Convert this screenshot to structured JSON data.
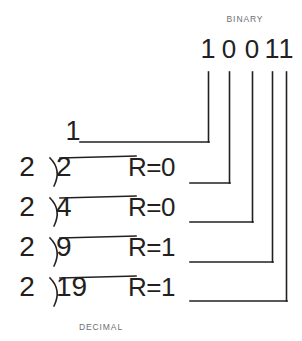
{
  "figure": {
    "title_top": "BINARY",
    "title_bottom": "DECIMAL",
    "ink_color": "#231f20",
    "label_color": "#6d6e71",
    "background": "#ffffff"
  },
  "binary_result": {
    "digits": [
      "1",
      "0",
      "0",
      "1",
      "1"
    ],
    "value": "10011"
  },
  "quotient_top": {
    "value": "1"
  },
  "divisions": [
    {
      "divisor": "2",
      "dividend": "2",
      "remainder_label": "R=0",
      "remainder_value": "0"
    },
    {
      "divisor": "2",
      "dividend": "4",
      "remainder_label": "R=0",
      "remainder_value": "0"
    },
    {
      "divisor": "2",
      "dividend": "9",
      "remainder_label": "R=1",
      "remainder_value": "1"
    },
    {
      "divisor": "2",
      "dividend": "19",
      "remainder_label": "R=1",
      "remainder_value": "1"
    }
  ]
}
